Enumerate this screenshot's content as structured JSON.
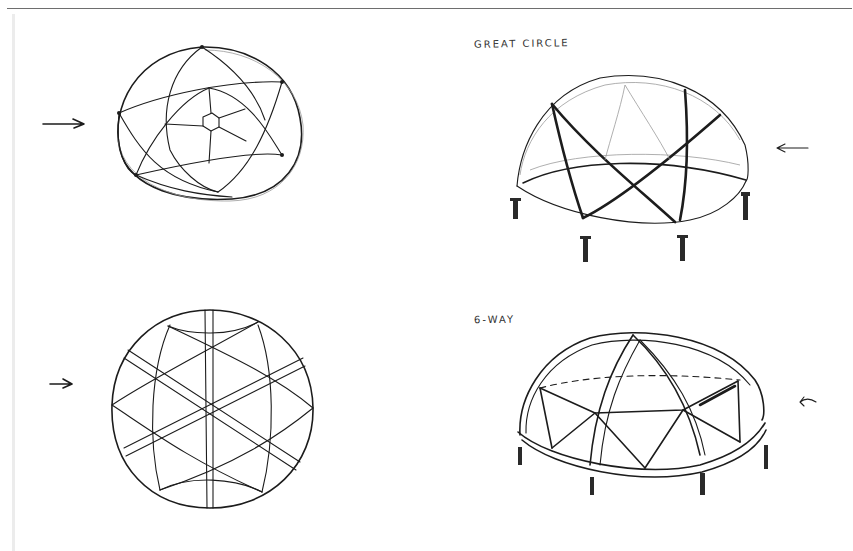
{
  "page": {
    "type": "hand-drawn sketch sheet",
    "background_color": "#ffffff",
    "ink_color": "#1c1c1c"
  },
  "labels": {
    "great_circle": "GREAT CIRCLE",
    "six_way": "6-WAY"
  },
  "sketches": [
    {
      "id": "top-left",
      "subject": "sphere top view, curved lattice with hexagon hub",
      "arrow": "right"
    },
    {
      "id": "top-right",
      "subject": "great circle dome on five posts",
      "label_ref": "great_circle",
      "arrow": "left"
    },
    {
      "id": "bottom-left",
      "subject": "sphere with three crossing double-line bands",
      "arrow": "right"
    },
    {
      "id": "bottom-right",
      "subject": "6-way dome with triangulated ring on posts",
      "label_ref": "six_way",
      "arrow": "left"
    }
  ],
  "icons": {
    "arrow_right": "arrow-right-icon",
    "arrow_left": "arrow-left-icon"
  }
}
